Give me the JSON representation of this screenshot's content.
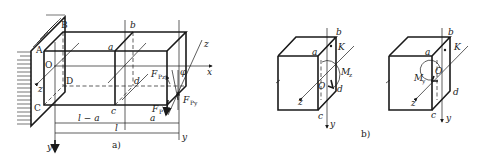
{
  "figure": {
    "part_a": {
      "caption": "a)",
      "points": {
        "A": "A",
        "B": "B",
        "C": "C",
        "D": "D",
        "O": "O",
        "a": "a",
        "b": "b",
        "c": "c",
        "d": "d"
      },
      "axes": {
        "x": "x",
        "y": "y",
        "z": "z",
        "y_right": "y",
        "z_right": "z"
      },
      "angle": "φ",
      "forces": {
        "Fpz": {
          "main": "F",
          "sub": "Pz"
        },
        "Fpy": {
          "main": "F",
          "sub": "Py"
        },
        "Fp": {
          "main": "F",
          "sub": "P"
        }
      },
      "dimensions": {
        "l_minus_a": "l − a",
        "a": "a",
        "l": "l"
      }
    },
    "part_b": {
      "caption": "b)",
      "left_element": {
        "points": {
          "a": "a",
          "b": "b",
          "c": "c",
          "d": "d",
          "K": "K",
          "O": "O"
        },
        "axes": {
          "y": "y",
          "z": "z"
        },
        "moment": {
          "main": "M",
          "sub": "z"
        }
      },
      "right_element": {
        "points": {
          "a": "a",
          "b": "b",
          "c": "c",
          "d": "d",
          "K": "K",
          "O": "O"
        },
        "axes": {
          "y": "y",
          "z": "z"
        },
        "moment": {
          "main": "M",
          "sub": "y"
        }
      }
    }
  }
}
